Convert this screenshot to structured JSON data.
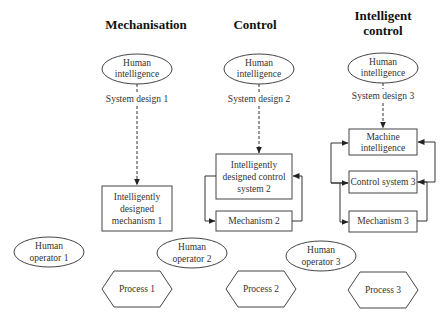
{
  "columns": [
    {
      "title_lines": [
        "Mechanisation"
      ],
      "human_intelligence": [
        "Human",
        "intelligence"
      ],
      "system_design": "System design 1",
      "boxes": [
        {
          "lines": [
            "Intelligently",
            "designed",
            "mechanism 1"
          ]
        }
      ],
      "operator": [
        "Human",
        "operator 1"
      ],
      "process": "Process 1"
    },
    {
      "title_lines": [
        "Control"
      ],
      "human_intelligence": [
        "Human",
        "intelligence"
      ],
      "system_design": "System design 2",
      "boxes": [
        {
          "lines": [
            "Intelligently",
            "designed control",
            "system 2"
          ]
        },
        {
          "lines": [
            "Mechanism 2"
          ]
        }
      ],
      "operator": [
        "Human",
        "operator 2"
      ],
      "process": "Process 2"
    },
    {
      "title_lines": [
        "Intelligent",
        "control"
      ],
      "human_intelligence": [
        "Human",
        "intelligence"
      ],
      "system_design": "System design 3",
      "boxes": [
        {
          "lines": [
            "Machine",
            "intelligence"
          ]
        },
        {
          "lines": [
            "Control system 3"
          ]
        },
        {
          "lines": [
            "Mechanism 3"
          ]
        }
      ],
      "operator": [
        "Human",
        "operator 3"
      ],
      "process": "Process 3"
    }
  ]
}
